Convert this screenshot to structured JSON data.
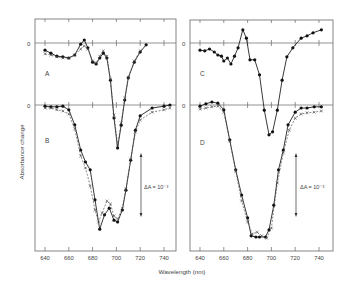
{
  "chart_data": {
    "type": "line",
    "title": "",
    "xlabel": "Wavelength (nm)",
    "ylabel": "Absorbance change",
    "scale_bar": "ΔA = 10⁻³",
    "xticks": [
      640,
      660,
      680,
      700,
      720,
      740
    ],
    "xlim": [
      632,
      750
    ],
    "grid": false,
    "legend": "none; markers: filled circles (solid line) and crosses (dashed line)",
    "panels": [
      {
        "name": "A",
        "position": "left-top",
        "zero_label": "0",
        "units": "ΔA ×10⁻³ relative to panel zero line",
        "series": [
          {
            "name": "circles (solid)",
            "marker": "filled-circle",
            "x": [
              640,
              645,
              650,
              655,
              660,
              665,
              670,
              673,
              676,
              680,
              683,
              686,
              689,
              692,
              695,
              698,
              701,
              704,
              707,
              710,
              715,
              720,
              725
            ],
            "y": [
              -0.12,
              -0.17,
              -0.22,
              -0.23,
              -0.25,
              -0.2,
              -0.02,
              0.05,
              -0.08,
              -0.32,
              -0.35,
              -0.25,
              -0.17,
              -0.25,
              -0.62,
              -1.25,
              -1.75,
              -1.37,
              -0.95,
              -0.58,
              -0.32,
              -0.15,
              -0.03
            ]
          },
          {
            "name": "crosses (dashed)",
            "marker": "cross",
            "x": [
              640,
              645,
              650,
              655,
              660,
              665,
              670,
              673,
              676,
              680,
              683,
              686,
              689,
              692,
              695,
              698,
              701,
              704,
              707,
              710,
              715,
              720
            ],
            "y": [
              -0.18,
              -0.2,
              -0.23,
              -0.25,
              -0.25,
              -0.2,
              -0.1,
              -0.05,
              -0.1,
              -0.3,
              -0.33,
              -0.22,
              -0.13,
              -0.22,
              -0.6,
              -1.2,
              -1.7,
              -1.33,
              -0.92,
              -0.57,
              -0.3,
              -0.13
            ]
          }
        ]
      },
      {
        "name": "B",
        "position": "left-bottom",
        "zero_label": "0",
        "units": "ΔA ×10⁻³ relative to panel zero line",
        "series": [
          {
            "name": "circles (solid)",
            "marker": "filled-circle",
            "x": [
              640,
              645,
              650,
              655,
              660,
              665,
              670,
              674,
              678,
              682,
              686,
              690,
              694,
              698,
              701,
              705,
              708,
              712,
              716,
              720,
              730,
              740,
              745
            ],
            "y": [
              -0.02,
              -0.03,
              -0.03,
              -0.02,
              -0.08,
              -0.33,
              -0.75,
              -0.95,
              -1.08,
              -1.58,
              -2.07,
              -1.83,
              -1.72,
              -1.92,
              -1.95,
              -1.75,
              -1.42,
              -0.92,
              -0.42,
              -0.18,
              -0.05,
              -0.02,
              0.0
            ]
          },
          {
            "name": "crosses (dashed)",
            "marker": "cross",
            "x": [
              640,
              645,
              650,
              655,
              660,
              665,
              670,
              674,
              678,
              682,
              685,
              688,
              692,
              695,
              698,
              701,
              705,
              708,
              712,
              716,
              720,
              730,
              740,
              745
            ],
            "y": [
              -0.05,
              -0.05,
              -0.08,
              -0.1,
              -0.15,
              -0.4,
              -0.85,
              -1.05,
              -1.35,
              -1.75,
              -1.95,
              -1.8,
              -1.6,
              -1.65,
              -1.85,
              -1.9,
              -1.72,
              -1.4,
              -0.9,
              -0.45,
              -0.25,
              -0.12,
              -0.08,
              -0.05
            ]
          }
        ]
      },
      {
        "name": "C",
        "position": "right-top",
        "zero_label": "0",
        "units": "ΔA ×10⁻³ relative to panel zero line",
        "series": [
          {
            "name": "circles (solid)",
            "marker": "filled-circle",
            "x": [
              640,
              644,
              648,
              652,
              655,
              658,
              660,
              663,
              666,
              669,
              672,
              676,
              679,
              682,
              686,
              690,
              694,
              698,
              701,
              705,
              709,
              713,
              718,
              725,
              730,
              735,
              742
            ],
            "y": [
              -0.12,
              -0.13,
              -0.1,
              -0.15,
              -0.2,
              -0.22,
              -0.3,
              -0.25,
              -0.35,
              -0.22,
              -0.08,
              0.22,
              0.08,
              -0.28,
              -0.28,
              -0.53,
              -1.12,
              -1.53,
              -1.48,
              -1.12,
              -0.62,
              -0.23,
              -0.08,
              0.08,
              0.12,
              0.17,
              0.22
            ]
          }
        ]
      },
      {
        "name": "D",
        "position": "right-bottom",
        "zero_label": "0",
        "units": "ΔA ×10⁻³ relative to panel zero line",
        "series": [
          {
            "name": "circles (solid)",
            "marker": "filled-circle",
            "x": [
              640,
              645,
              650,
              655,
              660,
              665,
              670,
              675,
              680,
              683,
              687,
              690,
              695,
              698,
              702,
              706,
              710,
              714,
              720,
              725,
              730,
              736,
              742
            ],
            "y": [
              -0.02,
              0.02,
              0.05,
              0.03,
              -0.08,
              -0.58,
              -1.08,
              -1.5,
              -1.88,
              -2.18,
              -2.2,
              -2.2,
              -2.2,
              -2.08,
              -1.67,
              -1.08,
              -0.75,
              -0.33,
              -0.12,
              -0.05,
              -0.05,
              -0.03,
              -0.03
            ]
          },
          {
            "name": "crosses (dashed)",
            "marker": "cross",
            "x": [
              640,
              645,
              650,
              655,
              660,
              665,
              670,
              675,
              680,
              684,
              688,
              692,
              696,
              700,
              705,
              710,
              715,
              720,
              725,
              730,
              736,
              742
            ],
            "y": [
              -0.07,
              -0.05,
              -0.03,
              -0.02,
              -0.12,
              -0.6,
              -1.1,
              -1.6,
              -1.95,
              -2.15,
              -2.12,
              -2.18,
              -2.22,
              -2.05,
              -1.3,
              -0.8,
              -0.42,
              -0.22,
              -0.15,
              -0.13,
              -0.12,
              -0.1
            ]
          }
        ]
      }
    ]
  },
  "labels": {
    "panel_a": "A",
    "panel_b": "B",
    "panel_c": "C",
    "panel_d": "D",
    "zero": "0",
    "ylabel": "Absorbance change",
    "xlabel": "Wavelength (nm)",
    "scale_bar": "ΔA = 10⁻³",
    "tick_labels": [
      "640",
      "660",
      "680",
      "700",
      "720",
      "740"
    ]
  }
}
